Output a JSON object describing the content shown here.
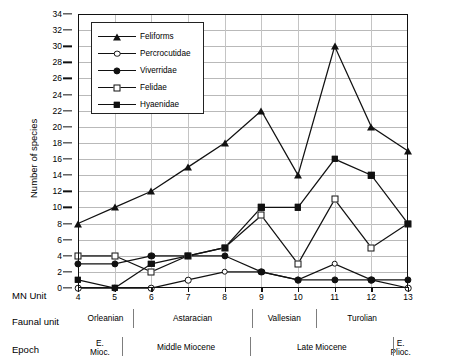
{
  "chart_data": {
    "type": "line",
    "title": "",
    "xlabel": "MN Unit",
    "ylabel": "Number of species",
    "x": [
      4,
      5,
      6,
      7,
      8,
      9,
      10,
      11,
      12,
      13
    ],
    "categories": [
      "4",
      "5",
      "6",
      "7",
      "8",
      "9",
      "10",
      "11",
      "12",
      "13"
    ],
    "xlim": [
      4,
      13
    ],
    "ylim": [
      0,
      34
    ],
    "ytick_step": 2,
    "yticks": [
      0,
      2,
      4,
      6,
      8,
      10,
      12,
      14,
      16,
      18,
      20,
      22,
      24,
      26,
      28,
      30,
      32,
      34
    ],
    "grid": true,
    "legend_position": "top-left",
    "series": [
      {
        "name": "Feliforms",
        "marker": "filled-triangle",
        "values": [
          8,
          10,
          12,
          15,
          18,
          22,
          14,
          30,
          20,
          17
        ]
      },
      {
        "name": "Percrocutidae",
        "marker": "open-circle",
        "values": [
          0,
          0,
          0,
          1,
          2,
          2,
          1,
          3,
          1,
          0
        ]
      },
      {
        "name": "Viverridae",
        "marker": "filled-circle",
        "values": [
          3,
          3,
          4,
          4,
          4,
          2,
          1,
          1,
          1,
          1
        ]
      },
      {
        "name": "Felidae",
        "marker": "open-square",
        "values": [
          4,
          4,
          2,
          4,
          5,
          9,
          3,
          11,
          5,
          8
        ]
      },
      {
        "name": "Hyaenidae",
        "marker": "filled-square",
        "values": [
          1,
          0,
          3,
          4,
          5,
          10,
          10,
          16,
          14,
          8
        ]
      }
    ],
    "axis_rows": [
      {
        "label": "MN Unit",
        "cells": [
          {
            "text": "4",
            "start": 4,
            "end": 4
          },
          {
            "text": "5",
            "start": 5,
            "end": 5
          },
          {
            "text": "6",
            "start": 6,
            "end": 6
          },
          {
            "text": "7",
            "start": 7,
            "end": 7
          },
          {
            "text": "8",
            "start": 8,
            "end": 8
          },
          {
            "text": "9",
            "start": 9,
            "end": 9
          },
          {
            "text": "10",
            "start": 10,
            "end": 10
          },
          {
            "text": "11",
            "start": 11,
            "end": 11
          },
          {
            "text": "12",
            "start": 12,
            "end": 12
          },
          {
            "text": "13",
            "start": 13,
            "end": 13
          }
        ]
      },
      {
        "label": "Faunal unit",
        "cells": [
          {
            "text": "Orleanian",
            "start": 4,
            "end": 5.5
          },
          {
            "text": "Astaracian",
            "start": 5.5,
            "end": 8.75
          },
          {
            "text": "Vallesian",
            "start": 8.75,
            "end": 10.5
          },
          {
            "text": "Turolian",
            "start": 10.5,
            "end": 13
          }
        ]
      },
      {
        "label": "Epoch",
        "cells": [
          {
            "text": "E. Mioc.",
            "line1": "E.",
            "line2": "Mioc.",
            "start": 4,
            "end": 5.2
          },
          {
            "text": "Middle Miocene",
            "line1": "Middle Miocene",
            "line2": "",
            "start": 5.2,
            "end": 8.7
          },
          {
            "text": "Late Miocene",
            "line1": "Late Miocene",
            "line2": "",
            "start": 8.7,
            "end": 12.6
          },
          {
            "text": "E. Plioc.",
            "line1": "E.",
            "line2": "Plioc.",
            "start": 12.6,
            "end": 13
          }
        ]
      }
    ],
    "colors": {
      "line": "#111111",
      "grid": "#b9b9b9",
      "axis": "#111111",
      "background": "#ffffff"
    }
  }
}
